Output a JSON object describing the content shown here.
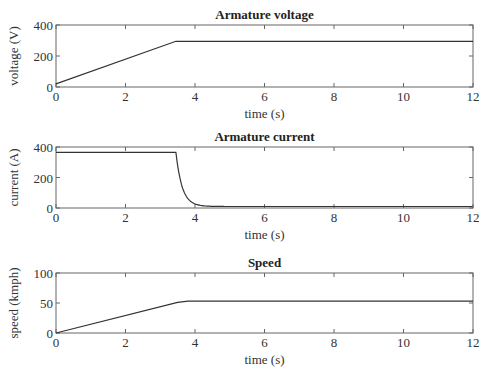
{
  "figure": {
    "caption": "Figure 3.x  Vehicle drive simulation"
  },
  "chart_data": [
    {
      "type": "line",
      "title": "Armature voltage",
      "xlabel": "time (s)",
      "ylabel": "voltage (V)",
      "xlim": [
        0,
        12
      ],
      "ylim": [
        0,
        400
      ],
      "xticks": [
        "0",
        "2",
        "4",
        "6",
        "8",
        "10",
        "12"
      ],
      "yticks": [
        "0",
        "200",
        "400"
      ],
      "grid": false,
      "series": [
        {
          "name": "Armature voltage",
          "x": [
            0,
            3.45,
            12
          ],
          "y": [
            20,
            295,
            295
          ]
        }
      ]
    },
    {
      "type": "line",
      "title": "Armature current",
      "xlabel": "time (s)",
      "ylabel": "current (A)",
      "xlim": [
        0,
        12
      ],
      "ylim": [
        0,
        400
      ],
      "xticks": [
        "0",
        "2",
        "4",
        "6",
        "8",
        "10",
        "12"
      ],
      "yticks": [
        "0",
        "200",
        "400"
      ],
      "grid": false,
      "series": [
        {
          "name": "Armature current",
          "x": [
            0,
            3.45,
            3.55,
            3.65,
            3.75,
            3.85,
            4.0,
            4.2,
            4.5,
            5.0,
            12
          ],
          "y": [
            365,
            365,
            250,
            150,
            90,
            55,
            30,
            18,
            12,
            10,
            10
          ]
        }
      ]
    },
    {
      "type": "line",
      "title": "Speed",
      "xlabel": "time (s)",
      "ylabel": "speed (kmph)",
      "xlim": [
        0,
        12
      ],
      "ylim": [
        0,
        100
      ],
      "xticks": [
        "0",
        "2",
        "4",
        "6",
        "8",
        "10",
        "12"
      ],
      "yticks": [
        "0",
        "50",
        "100"
      ],
      "grid": false,
      "series": [
        {
          "name": "Speed",
          "x": [
            0,
            3.5,
            3.8,
            4.2,
            12
          ],
          "y": [
            0,
            51,
            53,
            53,
            53
          ]
        }
      ]
    }
  ]
}
